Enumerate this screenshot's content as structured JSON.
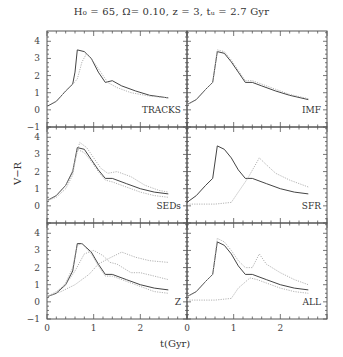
{
  "figure": {
    "title": "H₀ = 65, Ω= 0.10, z = 3, tᵤ = 2.7 Gyr",
    "xlabel": "t(Gyr)",
    "ylabel": "V−R"
  },
  "chart_data": {
    "type": "line",
    "xlabel": "t(Gyr)",
    "ylabel": "V-R",
    "xlim": [
      0,
      3
    ],
    "ylim": [
      -1,
      4.6
    ],
    "xticks": [
      0,
      1,
      2
    ],
    "yticks": [
      -1,
      0,
      1,
      2,
      3,
      4
    ],
    "layout": "3 rows x 2 columns, shared axes",
    "grid": false,
    "panels": [
      {
        "label": "TRACKS",
        "series": [
          {
            "name": "solid",
            "style": "solid",
            "x": [
              0,
              0.2,
              0.4,
              0.55,
              0.6,
              0.65,
              0.8,
              0.95,
              1.1,
              1.25,
              1.4,
              1.6,
              1.9,
              2.2,
              2.6
            ],
            "y": [
              0.2,
              0.5,
              1.1,
              1.5,
              2.2,
              3.5,
              3.4,
              3.0,
              2.2,
              1.6,
              1.7,
              1.4,
              1.1,
              0.85,
              0.7
            ]
          },
          {
            "name": "dotted",
            "style": "dotted",
            "x": [
              0,
              0.2,
              0.4,
              0.55,
              0.65,
              0.75,
              0.85,
              1.0,
              1.15,
              1.3,
              1.5,
              1.8,
              2.2,
              2.6
            ],
            "y": [
              0.2,
              0.5,
              1.1,
              1.5,
              1.8,
              2.8,
              3.3,
              2.8,
              2.2,
              1.6,
              1.3,
              1.0,
              0.8,
              0.7
            ]
          }
        ]
      },
      {
        "label": "IMF",
        "series": [
          {
            "name": "solid",
            "style": "solid",
            "x": [
              0,
              0.2,
              0.4,
              0.55,
              0.65,
              0.8,
              0.95,
              1.1,
              1.25,
              1.4,
              1.6,
              1.9,
              2.2,
              2.6
            ],
            "y": [
              0.3,
              0.6,
              1.2,
              1.6,
              3.4,
              3.3,
              2.8,
              2.2,
              1.6,
              1.6,
              1.4,
              1.1,
              0.85,
              0.6
            ]
          },
          {
            "name": "dotted",
            "style": "dotted",
            "x": [
              0,
              0.2,
              0.4,
              0.55,
              0.65,
              0.8,
              0.95,
              1.1,
              1.25,
              1.4,
              1.6,
              1.9,
              2.2,
              2.6
            ],
            "y": [
              0.3,
              0.6,
              1.2,
              1.6,
              3.5,
              3.4,
              2.9,
              2.3,
              1.7,
              1.7,
              1.5,
              1.2,
              0.9,
              0.65
            ]
          }
        ]
      },
      {
        "label": "SEDs",
        "series": [
          {
            "name": "solid",
            "style": "solid",
            "x": [
              0,
              0.2,
              0.4,
              0.55,
              0.65,
              0.8,
              0.95,
              1.1,
              1.25,
              1.4,
              1.7,
              2.0,
              2.3,
              2.6
            ],
            "y": [
              0.3,
              0.6,
              1.2,
              2.0,
              3.4,
              3.3,
              2.7,
              2.1,
              1.6,
              1.6,
              1.3,
              1.0,
              0.8,
              0.7
            ]
          },
          {
            "name": "dotted-upper",
            "style": "dotted",
            "x": [
              0,
              0.2,
              0.4,
              0.55,
              0.7,
              0.85,
              1.0,
              1.15,
              1.3,
              1.5,
              1.8,
              2.1,
              2.4,
              2.6
            ],
            "y": [
              0.3,
              0.6,
              1.2,
              2.1,
              3.7,
              3.4,
              2.8,
              2.2,
              1.9,
              2.0,
              1.7,
              1.2,
              0.9,
              0.8
            ]
          },
          {
            "name": "dotted-lower",
            "style": "dotted",
            "x": [
              0,
              0.2,
              0.4,
              0.55,
              0.65,
              0.8,
              0.95,
              1.1,
              1.25,
              1.4,
              1.7,
              2.0,
              2.3,
              2.6
            ],
            "y": [
              0.3,
              0.5,
              1.0,
              1.8,
              3.3,
              3.1,
              2.6,
              2.0,
              1.5,
              1.4,
              1.1,
              0.8,
              0.6,
              0.5
            ]
          }
        ]
      },
      {
        "label": "SFR",
        "series": [
          {
            "name": "solid",
            "style": "solid",
            "x": [
              0,
              0.2,
              0.4,
              0.55,
              0.65,
              0.8,
              0.95,
              1.1,
              1.25,
              1.4,
              1.7,
              2.0,
              2.3,
              2.6
            ],
            "y": [
              0.2,
              0.6,
              1.2,
              1.6,
              3.5,
              3.3,
              2.8,
              2.1,
              1.6,
              1.6,
              1.3,
              1.0,
              0.8,
              0.7
            ]
          },
          {
            "name": "dotted",
            "style": "dotted",
            "x": [
              0,
              0.3,
              0.6,
              0.95,
              1.1,
              1.3,
              1.55,
              1.7,
              1.9,
              2.2,
              2.6
            ],
            "y": [
              0.1,
              0.1,
              0.1,
              0.2,
              0.8,
              1.6,
              2.8,
              2.4,
              1.9,
              1.5,
              1.1
            ]
          }
        ]
      },
      {
        "label": "Z",
        "series": [
          {
            "name": "solid",
            "style": "solid",
            "x": [
              0,
              0.2,
              0.4,
              0.55,
              0.65,
              0.75,
              0.95,
              1.1,
              1.25,
              1.4,
              1.7,
              2.0,
              2.3,
              2.6
            ],
            "y": [
              0.3,
              0.5,
              1.0,
              1.8,
              3.4,
              3.4,
              2.9,
              2.2,
              1.6,
              1.6,
              1.3,
              1.0,
              0.8,
              0.7
            ]
          },
          {
            "name": "dotted-a",
            "style": "dotted",
            "x": [
              0,
              0.2,
              0.4,
              0.55,
              0.65,
              0.75,
              0.95,
              1.1,
              1.25,
              1.4,
              1.7,
              2.0,
              2.3,
              2.6
            ],
            "y": [
              0.3,
              0.5,
              1.1,
              2.0,
              3.3,
              3.4,
              2.8,
              2.1,
              1.5,
              1.5,
              1.2,
              0.9,
              0.6,
              0.5
            ]
          },
          {
            "name": "dotted-b",
            "style": "dotted",
            "x": [
              0,
              0.2,
              0.4,
              0.6,
              0.8,
              1.0,
              1.2,
              1.35,
              1.5,
              1.8,
              2.0,
              2.3,
              2.6
            ],
            "y": [
              0.3,
              0.6,
              1.0,
              1.8,
              2.8,
              3.0,
              2.7,
              2.3,
              2.2,
              1.7,
              1.7,
              1.5,
              1.3
            ]
          },
          {
            "name": "dotted-c",
            "style": "dotted",
            "x": [
              0,
              0.3,
              0.6,
              0.9,
              1.1,
              1.3,
              1.6,
              1.9,
              2.2,
              2.6
            ],
            "y": [
              0.3,
              0.6,
              1.0,
              1.6,
              2.2,
              2.5,
              2.9,
              2.6,
              2.4,
              2.3
            ]
          }
        ]
      },
      {
        "label": "ALL",
        "series": [
          {
            "name": "solid",
            "style": "solid",
            "x": [
              0,
              0.2,
              0.4,
              0.55,
              0.65,
              0.8,
              0.95,
              1.1,
              1.25,
              1.4,
              1.7,
              2.0,
              2.3,
              2.6
            ],
            "y": [
              0.3,
              0.6,
              1.2,
              1.6,
              3.5,
              3.3,
              2.8,
              2.1,
              1.6,
              1.6,
              1.3,
              1.0,
              0.8,
              0.7
            ]
          },
          {
            "name": "dotted-upper",
            "style": "dotted",
            "x": [
              0,
              0.2,
              0.4,
              0.55,
              0.65,
              0.8,
              0.95,
              1.1,
              1.25,
              1.4,
              1.55,
              1.7,
              2.0,
              2.3,
              2.6
            ],
            "y": [
              0.3,
              0.6,
              1.2,
              1.6,
              3.7,
              3.5,
              3.0,
              2.4,
              2.0,
              2.0,
              2.8,
              2.2,
              1.7,
              1.3,
              1.0
            ]
          },
          {
            "name": "dotted-lower",
            "style": "dotted",
            "x": [
              0,
              0.3,
              0.6,
              0.95,
              1.1,
              1.35,
              1.5,
              1.7,
              2.0,
              2.3,
              2.6
            ],
            "y": [
              0.1,
              0.1,
              0.1,
              0.2,
              0.8,
              1.4,
              1.3,
              1.1,
              0.8,
              0.6,
              0.5
            ]
          }
        ]
      }
    ]
  }
}
